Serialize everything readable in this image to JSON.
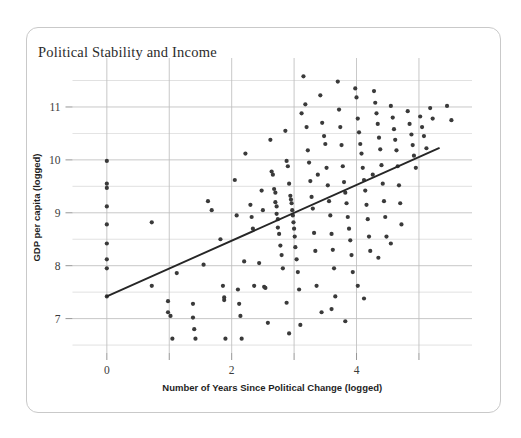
{
  "card": {
    "border_color": "#c9c9c9",
    "background": "#ffffff"
  },
  "chart_data": {
    "type": "scatter",
    "title": "Political Stability and Income",
    "xlabel": "Number of Years Since Political Change (logged)",
    "ylabel": "GDP per capita (logged)",
    "xlim": [
      -0.55,
      5.85
    ],
    "ylim": [
      6.35,
      11.85
    ],
    "xticks": [
      0,
      2,
      4
    ],
    "xticklabels": [
      "0",
      "2",
      "4"
    ],
    "xminor": [
      1,
      3,
      5
    ],
    "yticks": [
      7,
      8,
      9,
      10,
      11
    ],
    "yticklabels": [
      "7",
      "8",
      "9",
      "10",
      "11"
    ],
    "yminor": [
      6.5,
      7.5,
      8.5,
      9.5,
      10.5,
      11.5
    ],
    "grid": true,
    "grid_color": "#bfbfbf",
    "point_color": "#3a3a3a",
    "point_size": 4.2,
    "legend": "none",
    "trendline": {
      "type": "linear",
      "color": "#262626",
      "width": 1.9,
      "x0": 0.0,
      "y0": 7.42,
      "x1": 5.32,
      "y1": 10.22,
      "slope": 0.526,
      "intercept": 7.42
    },
    "points": [
      [
        0.0,
        9.98
      ],
      [
        0.0,
        9.55
      ],
      [
        0.0,
        9.47
      ],
      [
        0.0,
        9.12
      ],
      [
        0.0,
        8.78
      ],
      [
        0.0,
        8.42
      ],
      [
        0.0,
        8.12
      ],
      [
        0.0,
        7.95
      ],
      [
        0.0,
        7.42
      ],
      [
        0.72,
        8.82
      ],
      [
        0.72,
        7.62
      ],
      [
        0.98,
        7.33
      ],
      [
        0.98,
        7.12
      ],
      [
        1.02,
        7.05
      ],
      [
        1.05,
        6.62
      ],
      [
        1.12,
        7.86
      ],
      [
        1.38,
        7.28
      ],
      [
        1.38,
        7.02
      ],
      [
        1.4,
        6.8
      ],
      [
        1.42,
        6.62
      ],
      [
        1.62,
        9.22
      ],
      [
        1.68,
        9.05
      ],
      [
        1.82,
        8.5
      ],
      [
        1.86,
        7.62
      ],
      [
        1.88,
        7.4
      ],
      [
        1.88,
        7.35
      ],
      [
        1.9,
        6.62
      ],
      [
        2.05,
        9.62
      ],
      [
        2.08,
        8.95
      ],
      [
        2.1,
        7.55
      ],
      [
        2.12,
        7.28
      ],
      [
        2.14,
        7.05
      ],
      [
        2.16,
        6.62
      ],
      [
        2.3,
        9.15
      ],
      [
        2.32,
        8.92
      ],
      [
        2.34,
        8.7
      ],
      [
        2.36,
        7.62
      ],
      [
        2.48,
        9.42
      ],
      [
        2.5,
        9.05
      ],
      [
        2.52,
        7.6
      ],
      [
        2.54,
        7.58
      ],
      [
        2.58,
        6.92
      ],
      [
        2.62,
        10.38
      ],
      [
        2.64,
        9.78
      ],
      [
        2.66,
        9.72
      ],
      [
        2.68,
        9.45
      ],
      [
        2.7,
        9.38
      ],
      [
        2.7,
        9.2
      ],
      [
        2.72,
        9.12
      ],
      [
        2.72,
        8.98
      ],
      [
        2.74,
        8.88
      ],
      [
        2.74,
        8.72
      ],
      [
        2.76,
        8.6
      ],
      [
        2.78,
        8.38
      ],
      [
        2.8,
        8.2
      ],
      [
        2.82,
        7.95
      ],
      [
        2.86,
        10.55
      ],
      [
        2.88,
        9.98
      ],
      [
        2.9,
        9.88
      ],
      [
        2.92,
        9.55
      ],
      [
        2.94,
        9.32
      ],
      [
        2.95,
        9.25
      ],
      [
        2.96,
        9.18
      ],
      [
        2.97,
        9.05
      ],
      [
        2.98,
        8.95
      ],
      [
        2.99,
        8.82
      ],
      [
        3.0,
        8.7
      ],
      [
        3.01,
        8.55
      ],
      [
        3.02,
        8.35
      ],
      [
        3.04,
        8.12
      ],
      [
        3.06,
        7.88
      ],
      [
        3.08,
        7.55
      ],
      [
        3.1,
        6.88
      ],
      [
        3.15,
        11.58
      ],
      [
        3.18,
        11.05
      ],
      [
        3.2,
        10.62
      ],
      [
        3.22,
        10.18
      ],
      [
        3.24,
        9.95
      ],
      [
        3.26,
        9.6
      ],
      [
        3.28,
        9.3
      ],
      [
        3.3,
        9.08
      ],
      [
        3.32,
        8.62
      ],
      [
        3.34,
        8.28
      ],
      [
        3.36,
        7.62
      ],
      [
        3.42,
        11.22
      ],
      [
        3.45,
        10.7
      ],
      [
        3.48,
        10.45
      ],
      [
        3.5,
        10.3
      ],
      [
        3.52,
        9.85
      ],
      [
        3.54,
        9.52
      ],
      [
        3.56,
        9.22
      ],
      [
        3.58,
        8.95
      ],
      [
        3.6,
        8.6
      ],
      [
        3.62,
        8.3
      ],
      [
        3.64,
        7.95
      ],
      [
        3.66,
        7.42
      ],
      [
        3.7,
        11.48
      ],
      [
        3.72,
        10.95
      ],
      [
        3.74,
        10.62
      ],
      [
        3.76,
        10.28
      ],
      [
        3.78,
        9.88
      ],
      [
        3.8,
        9.58
      ],
      [
        3.82,
        9.38
      ],
      [
        3.84,
        9.18
      ],
      [
        3.86,
        8.92
      ],
      [
        3.88,
        8.7
      ],
      [
        3.9,
        8.48
      ],
      [
        3.92,
        8.2
      ],
      [
        3.94,
        7.88
      ],
      [
        3.98,
        11.35
      ],
      [
        4.0,
        11.18
      ],
      [
        4.02,
        10.78
      ],
      [
        4.04,
        10.52
      ],
      [
        4.06,
        10.3
      ],
      [
        4.08,
        10.12
      ],
      [
        4.1,
        9.85
      ],
      [
        4.12,
        9.62
      ],
      [
        4.14,
        9.42
      ],
      [
        4.16,
        9.15
      ],
      [
        4.18,
        8.88
      ],
      [
        4.2,
        8.55
      ],
      [
        4.22,
        8.28
      ],
      [
        4.28,
        11.3
      ],
      [
        4.3,
        11.08
      ],
      [
        4.32,
        10.88
      ],
      [
        4.34,
        10.68
      ],
      [
        4.36,
        10.42
      ],
      [
        4.38,
        10.2
      ],
      [
        4.4,
        9.9
      ],
      [
        4.42,
        9.55
      ],
      [
        4.44,
        9.22
      ],
      [
        4.46,
        8.92
      ],
      [
        4.48,
        8.55
      ],
      [
        4.55,
        11.02
      ],
      [
        4.58,
        10.8
      ],
      [
        4.6,
        10.58
      ],
      [
        4.62,
        10.38
      ],
      [
        4.64,
        10.18
      ],
      [
        4.66,
        9.88
      ],
      [
        4.68,
        9.52
      ],
      [
        4.7,
        9.18
      ],
      [
        4.72,
        8.78
      ],
      [
        4.82,
        10.92
      ],
      [
        4.85,
        10.68
      ],
      [
        4.88,
        10.48
      ],
      [
        4.9,
        10.28
      ],
      [
        4.92,
        10.08
      ],
      [
        4.95,
        9.85
      ],
      [
        5.02,
        10.82
      ],
      [
        5.05,
        10.62
      ],
      [
        5.08,
        10.45
      ],
      [
        5.12,
        10.22
      ],
      [
        5.18,
        10.98
      ],
      [
        5.22,
        10.78
      ],
      [
        5.45,
        11.02
      ],
      [
        5.52,
        10.75
      ],
      [
        2.22,
        10.12
      ],
      [
        3.12,
        10.88
      ],
      [
        3.38,
        9.72
      ],
      [
        4.26,
        9.72
      ],
      [
        2.44,
        8.05
      ],
      [
        3.44,
        7.12
      ],
      [
        2.92,
        6.72
      ],
      [
        3.82,
        6.95
      ],
      [
        4.02,
        7.62
      ],
      [
        4.12,
        7.38
      ],
      [
        1.55,
        8.02
      ],
      [
        2.2,
        8.08
      ],
      [
        2.88,
        7.3
      ],
      [
        3.6,
        7.18
      ],
      [
        4.35,
        8.15
      ],
      [
        4.55,
        8.42
      ]
    ]
  }
}
